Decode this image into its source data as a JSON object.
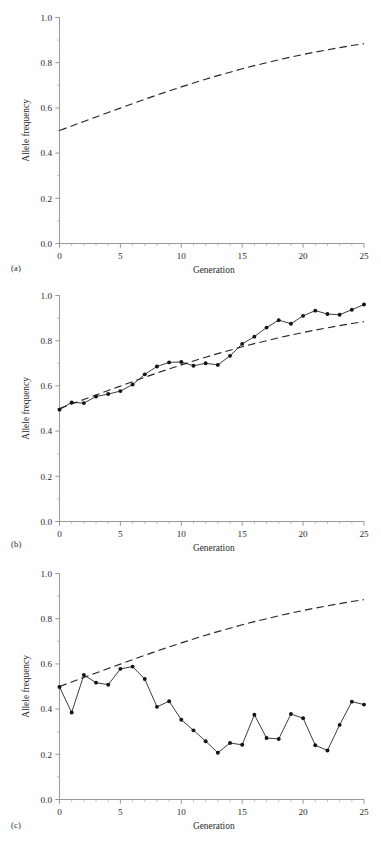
{
  "figure": {
    "background": "#fefefe",
    "ink": "#1c1c1c",
    "panel_count": 3
  },
  "panels": [
    {
      "id": "a",
      "label": "(a)"
    },
    {
      "id": "b",
      "label": "(b)"
    },
    {
      "id": "c",
      "label": "(c)"
    }
  ],
  "axes": {
    "xlabel": "Generation",
    "ylabel": "Allele frequency",
    "xlim": [
      0,
      25
    ],
    "ylim": [
      0.0,
      1.0
    ],
    "xticks": [
      0,
      5,
      10,
      15,
      20,
      25
    ],
    "xtick_labels": [
      "0",
      "5",
      "10",
      "15",
      "20",
      "25"
    ],
    "xminor_step": 1,
    "yticks": [
      0.0,
      0.2,
      0.4,
      0.6,
      0.8,
      1.0
    ],
    "ytick_labels": [
      "0.0",
      "0.2",
      "0.4",
      "0.6",
      "0.8",
      "1.0"
    ],
    "yminor_step": 0.1,
    "grid": "off",
    "legend": "none"
  },
  "chart_data": [
    {
      "type": "line",
      "panel": "(a)",
      "title": "",
      "xlabel": "Generation",
      "ylabel": "Allele frequency",
      "xlim": [
        0,
        25
      ],
      "ylim": [
        0.0,
        1.0
      ],
      "grid": "off",
      "legend": "none",
      "x": [
        0,
        1,
        2,
        3,
        4,
        5,
        6,
        7,
        8,
        9,
        10,
        11,
        12,
        13,
        14,
        15,
        16,
        17,
        18,
        19,
        20,
        21,
        22,
        23,
        24,
        25
      ],
      "series": [
        {
          "name": "Deterministic expectation",
          "style": "dashed",
          "marker": "none",
          "values": [
            0.5,
            0.52,
            0.54,
            0.56,
            0.58,
            0.599,
            0.619,
            0.638,
            0.657,
            0.675,
            0.693,
            0.71,
            0.727,
            0.743,
            0.758,
            0.773,
            0.787,
            0.8,
            0.813,
            0.825,
            0.836,
            0.847,
            0.857,
            0.867,
            0.876,
            0.884
          ]
        }
      ]
    },
    {
      "type": "line",
      "panel": "(b)",
      "title": "",
      "xlabel": "Generation",
      "ylabel": "Allele frequency",
      "xlim": [
        0,
        25
      ],
      "ylim": [
        0.0,
        1.0
      ],
      "grid": "off",
      "legend": "none",
      "x": [
        0,
        1,
        2,
        3,
        4,
        5,
        6,
        7,
        8,
        9,
        10,
        11,
        12,
        13,
        14,
        15,
        16,
        17,
        18,
        19,
        20,
        21,
        22,
        23,
        24,
        25
      ],
      "series": [
        {
          "name": "Deterministic expectation",
          "style": "dashed",
          "marker": "none",
          "values": [
            0.5,
            0.52,
            0.54,
            0.56,
            0.58,
            0.599,
            0.619,
            0.638,
            0.657,
            0.675,
            0.693,
            0.71,
            0.727,
            0.743,
            0.758,
            0.773,
            0.787,
            0.8,
            0.813,
            0.825,
            0.836,
            0.847,
            0.857,
            0.867,
            0.876,
            0.884
          ]
        },
        {
          "name": "Large population simulation",
          "style": "solid",
          "marker": "filled-circle",
          "values": [
            0.495,
            0.527,
            0.524,
            0.553,
            0.564,
            0.577,
            0.606,
            0.651,
            0.686,
            0.704,
            0.706,
            0.689,
            0.7,
            0.693,
            0.733,
            0.786,
            0.818,
            0.858,
            0.891,
            0.875,
            0.91,
            0.933,
            0.918,
            0.915,
            0.937,
            0.96
          ]
        }
      ]
    },
    {
      "type": "line",
      "panel": "(c)",
      "title": "",
      "xlabel": "Generation",
      "ylabel": "Allele frequency",
      "xlim": [
        0,
        25
      ],
      "ylim": [
        0.0,
        1.0
      ],
      "grid": "off",
      "legend": "none",
      "x": [
        0,
        1,
        2,
        3,
        4,
        5,
        6,
        7,
        8,
        9,
        10,
        11,
        12,
        13,
        14,
        15,
        16,
        17,
        18,
        19,
        20,
        21,
        22,
        23,
        24,
        25
      ],
      "series": [
        {
          "name": "Deterministic expectation",
          "style": "dashed",
          "marker": "none",
          "values": [
            0.5,
            0.52,
            0.54,
            0.56,
            0.58,
            0.599,
            0.619,
            0.638,
            0.657,
            0.675,
            0.693,
            0.71,
            0.727,
            0.743,
            0.758,
            0.773,
            0.787,
            0.8,
            0.813,
            0.825,
            0.836,
            0.847,
            0.857,
            0.867,
            0.876,
            0.884
          ]
        },
        {
          "name": "Small population simulation",
          "style": "solid",
          "marker": "filled-circle",
          "values": [
            0.498,
            0.385,
            0.551,
            0.517,
            0.508,
            0.578,
            0.588,
            0.533,
            0.41,
            0.435,
            0.353,
            0.306,
            0.258,
            0.207,
            0.25,
            0.242,
            0.375,
            0.272,
            0.268,
            0.378,
            0.36,
            0.24,
            0.217,
            0.33,
            0.433,
            0.42
          ]
        }
      ]
    }
  ]
}
